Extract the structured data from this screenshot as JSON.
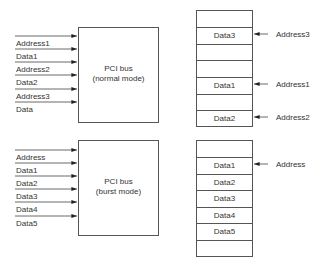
{
  "normal": {
    "box_line1": "PCI bus",
    "box_line2": "(normal mode)",
    "inputs": [
      "Address1",
      "Data1",
      "Address2",
      "Data2",
      "Address3",
      "Data"
    ],
    "memory": [
      "",
      "Data3",
      "",
      "",
      "Data1",
      "",
      "Data2"
    ],
    "pointers": [
      {
        "row": 1,
        "label": "Address3"
      },
      {
        "row": 4,
        "label": "Address1"
      },
      {
        "row": 6,
        "label": "Address2"
      }
    ]
  },
  "burst": {
    "box_line1": "PCI bus",
    "box_line2": "(burst mode)",
    "inputs": [
      "Address",
      "Data1",
      "Data2",
      "Data3",
      "Data4",
      "Data5"
    ],
    "memory": [
      "",
      "Data1",
      "Data2",
      "Data3",
      "Data4",
      "Data5",
      ""
    ],
    "pointers": [
      {
        "row": 1,
        "label": "Address"
      }
    ]
  }
}
